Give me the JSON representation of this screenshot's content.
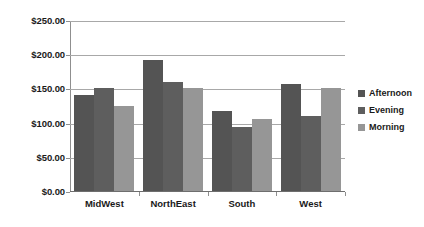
{
  "chart_data": {
    "type": "bar",
    "title": "",
    "subtitle": "",
    "xlabel": "",
    "ylabel": "",
    "categories": [
      "MidWest",
      "NorthEast",
      "South",
      "West"
    ],
    "series": [
      {
        "name": "Afternoon",
        "color": "#545454",
        "values": [
          140,
          192,
          117,
          156
        ]
      },
      {
        "name": "Evening",
        "color": "#5e5e5e",
        "values": [
          150,
          160,
          94,
          110
        ]
      },
      {
        "name": "Morning",
        "color": "#969696",
        "values": [
          125,
          150,
          105,
          150
        ]
      }
    ],
    "ylim": [
      0,
      250
    ],
    "ytick_values": [
      0,
      50,
      100,
      150,
      200,
      250
    ],
    "ytick_labels": [
      "$0.00",
      "$50.00",
      "$100.00",
      "$150.00",
      "$200.00",
      "$250.00"
    ],
    "grid": true,
    "legend_position": "right",
    "annotations": []
  },
  "axes": {
    "y": {
      "ticks": [
        {
          "label": "$250.00",
          "value": 250
        },
        {
          "label": "$200.00",
          "value": 200
        },
        {
          "label": "$150.00",
          "value": 150
        },
        {
          "label": "$100.00",
          "value": 100
        },
        {
          "label": "$50.00",
          "value": 50
        },
        {
          "label": "$0.00",
          "value": 0
        }
      ]
    },
    "x": {
      "ticks": [
        {
          "label": "MidWest"
        },
        {
          "label": "NorthEast"
        },
        {
          "label": "South"
        },
        {
          "label": "West"
        }
      ]
    }
  },
  "legend": {
    "items": [
      {
        "label": "Afternoon",
        "color": "#545454"
      },
      {
        "label": "Evening",
        "color": "#5e5e5e"
      },
      {
        "label": "Morning",
        "color": "#969696"
      }
    ]
  }
}
